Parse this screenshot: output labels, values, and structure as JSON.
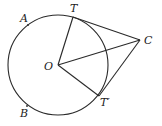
{
  "diagram": {
    "type": "geometry",
    "circle": {
      "center": "O",
      "cx": 58,
      "cy": 65,
      "r": 50
    },
    "points": {
      "O": {
        "label": "O",
        "x": 58,
        "y": 65,
        "lx": 44,
        "ly": 70
      },
      "T": {
        "label": "T",
        "x": 73,
        "y": 17,
        "lx": 70,
        "ly": 12
      },
      "C": {
        "label": "C",
        "x": 140,
        "y": 40,
        "lx": 144,
        "ly": 44
      },
      "T_prime": {
        "label": "T′",
        "x": 99,
        "y": 96,
        "lx": 100,
        "ly": 106
      },
      "A": {
        "label": "A",
        "x": 28,
        "y": 25,
        "lx": 20,
        "ly": 22
      },
      "B": {
        "label": "B",
        "x": 27,
        "y": 106,
        "lx": 20,
        "ly": 117
      }
    },
    "segments": [
      {
        "name": "OT",
        "from": "O",
        "to": "T"
      },
      {
        "name": "OC",
        "from": "O",
        "to": "C"
      },
      {
        "name": "OT_prime",
        "from": "O",
        "to": "T_prime"
      },
      {
        "name": "TC",
        "from": "T",
        "to": "C"
      },
      {
        "name": "T_primeC",
        "from": "T_prime",
        "to": "C"
      }
    ],
    "colors": {
      "line": "#2a2a2a",
      "background": "#ffffff"
    }
  }
}
